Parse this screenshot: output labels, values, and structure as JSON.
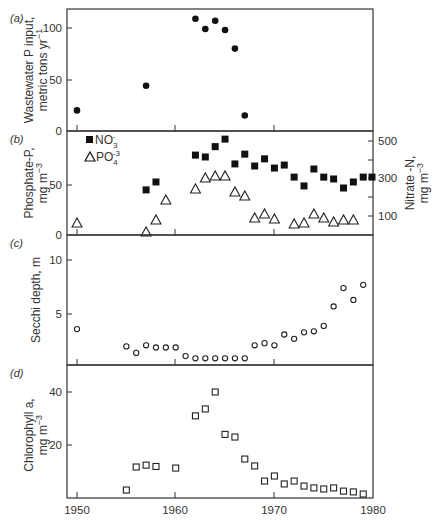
{
  "chart_data": [
    {
      "panel": "(a)",
      "type": "scatter",
      "title": "",
      "xlabel": "",
      "ylabel": "Wastewater P input, metric tons yr^-1",
      "ylabel_lines": [
        "Wastewater P input,",
        "metric tons yr",
        "−1"
      ],
      "ylim": [
        0,
        118
      ],
      "yticks": [
        0,
        50,
        100
      ],
      "xlim": [
        1949,
        1980
      ],
      "grid": false,
      "series": [
        {
          "name": "Wastewater P input",
          "marker": "filled-circle",
          "points": [
            [
              1950,
              20
            ],
            [
              1957,
              44
            ],
            [
              1962,
              109
            ],
            [
              1963,
              99
            ],
            [
              1964,
              107
            ],
            [
              1965,
              98
            ],
            [
              1966,
              80
            ],
            [
              1967,
              15
            ]
          ]
        }
      ]
    },
    {
      "panel": "(b)",
      "type": "scatter",
      "title": "",
      "xlabel": "",
      "ylabel": "Phosphate-P, mg m^-3",
      "ylabel_lines": [
        "Phosphate-P,",
        "mg m",
        "−3"
      ],
      "ylabel_right": "Nitrate-N, mg m^-3",
      "ylabel_right_lines": [
        "Nitrate -N,",
        "mg m",
        "−3"
      ],
      "ylim": [
        0,
        104
      ],
      "yticks": [
        0,
        50
      ],
      "ylim_right": [
        0,
        555
      ],
      "yticks_right": [
        100,
        300,
        500
      ],
      "yticks_right_minor": [
        200,
        400
      ],
      "xlim": [
        1949,
        1980
      ],
      "grid": false,
      "legend": {
        "position": "upper-left",
        "entries": [
          "NO3-",
          "PO4-3"
        ]
      },
      "series": [
        {
          "name": "NO3-",
          "axis": "right",
          "marker": "filled-square",
          "points": [
            [
              1957,
              240
            ],
            [
              1958,
              282
            ],
            [
              1962,
              425
            ],
            [
              1963,
              415
            ],
            [
              1964,
              470
            ],
            [
              1965,
              510
            ],
            [
              1966,
              378
            ],
            [
              1967,
              430
            ],
            [
              1968,
              367
            ],
            [
              1969,
              405
            ],
            [
              1970,
              356
            ],
            [
              1971,
              372
            ],
            [
              1972,
              308
            ],
            [
              1973,
              261
            ],
            [
              1974,
              351
            ],
            [
              1975,
              308
            ],
            [
              1976,
              298
            ],
            [
              1977,
              250
            ],
            [
              1978,
              282
            ],
            [
              1979,
              308
            ],
            [
              1980,
              308
            ]
          ]
        },
        {
          "name": "PO4-3",
          "axis": "left",
          "marker": "open-triangle",
          "points": [
            [
              1950,
              12
            ],
            [
              1957,
              3
            ],
            [
              1958,
              15
            ],
            [
              1959,
              35
            ],
            [
              1962,
              46
            ],
            [
              1963,
              57
            ],
            [
              1964,
              59
            ],
            [
              1965,
              59
            ],
            [
              1966,
              43
            ],
            [
              1967,
              39
            ],
            [
              1968,
              17
            ],
            [
              1969,
              21
            ],
            [
              1970,
              16
            ],
            [
              1972,
              11
            ],
            [
              1973,
              12
            ],
            [
              1974,
              21
            ],
            [
              1975,
              17
            ],
            [
              1976,
              13
            ],
            [
              1977,
              15
            ],
            [
              1978,
              15
            ]
          ]
        }
      ]
    },
    {
      "panel": "(c)",
      "type": "scatter",
      "title": "",
      "xlabel": "",
      "ylabel": "Secchi depth, m",
      "ylabel_lines": [
        "Secchi depth, m"
      ],
      "ylim": [
        0.3,
        10.0
      ],
      "yticks": [
        5,
        10
      ],
      "xlim": [
        1949,
        1980
      ],
      "grid": false,
      "series": [
        {
          "name": "Secchi depth",
          "marker": "open-circle",
          "points": [
            [
              1950,
              3.6
            ],
            [
              1955,
              2.0
            ],
            [
              1956,
              1.4
            ],
            [
              1957,
              2.1
            ],
            [
              1958,
              1.9
            ],
            [
              1959,
              1.9
            ],
            [
              1960,
              1.9
            ],
            [
              1961,
              1.1
            ],
            [
              1962,
              0.9
            ],
            [
              1963,
              0.9
            ],
            [
              1964,
              0.9
            ],
            [
              1965,
              0.9
            ],
            [
              1966,
              0.9
            ],
            [
              1967,
              0.9
            ],
            [
              1968,
              2.1
            ],
            [
              1969,
              2.3
            ],
            [
              1970,
              2.1
            ],
            [
              1971,
              3.1
            ],
            [
              1972,
              2.7
            ],
            [
              1973,
              3.3
            ],
            [
              1974,
              3.4
            ],
            [
              1975,
              3.9
            ],
            [
              1976,
              5.7
            ],
            [
              1977,
              7.4
            ],
            [
              1978,
              6.3
            ],
            [
              1979,
              7.7
            ]
          ]
        }
      ]
    },
    {
      "panel": "(d)",
      "type": "scatter",
      "title": "",
      "xlabel": "",
      "ylabel": "Chlorophyll a, mg m^-3",
      "ylabel_lines": [
        "Chlorophyll a,",
        "mg m",
        "−3"
      ],
      "ylim": [
        0,
        50
      ],
      "yticks": [
        20,
        40
      ],
      "xlim": [
        1949,
        1980
      ],
      "xticks": [
        1950,
        1960,
        1970,
        1980
      ],
      "grid": false,
      "series": [
        {
          "name": "Chlorophyll a",
          "marker": "open-square",
          "points": [
            [
              1955,
              3
            ],
            [
              1956,
              11.7
            ],
            [
              1957,
              12.4
            ],
            [
              1958,
              11.9
            ],
            [
              1960,
              11.3
            ],
            [
              1962,
              31
            ],
            [
              1963,
              33.6
            ],
            [
              1964,
              40
            ],
            [
              1965,
              24
            ],
            [
              1966,
              23
            ],
            [
              1967,
              14.7
            ],
            [
              1968,
              12.1
            ],
            [
              1969,
              6.4
            ],
            [
              1970,
              8.3
            ],
            [
              1971,
              5.3
            ],
            [
              1972,
              6.4
            ],
            [
              1973,
              4.5
            ],
            [
              1974,
              3.8
            ],
            [
              1975,
              3.4
            ],
            [
              1976,
              3.8
            ],
            [
              1977,
              2.6
            ],
            [
              1978,
              2.3
            ],
            [
              1979,
              1.5
            ]
          ]
        }
      ]
    }
  ],
  "labels": {
    "panel_a": "(a)",
    "panel_b": "(b)",
    "panel_c": "(c)",
    "panel_d": "(d)",
    "a_ylabel_1": "Wastewater P input,",
    "a_ylabel_2": "metric tons yr",
    "a_ylabel_sup": "−1",
    "b_ylabel_1": "Phosphate-P,",
    "b_ylabel_2": "mg m",
    "b_ylabel_sup": "−3",
    "b_ylabel_r1": "Nitrate -N,",
    "b_ylabel_r2": "mg m",
    "b_ylabel_rsup": "−3",
    "c_ylabel": "Secchi depth, m",
    "d_ylabel_1": "Chlorophyll a,",
    "d_ylabel_2": "mg m",
    "d_ylabel_sup": "−3",
    "legend_no3": "NO",
    "legend_no3_sub": "3",
    "legend_no3_sup": "-",
    "legend_po4": "PO",
    "legend_po4_sub": "4",
    "legend_po4_sup": "-3"
  },
  "ticks": {
    "a": [
      "0",
      "50",
      "100"
    ],
    "b_left": [
      "0",
      "50"
    ],
    "b_right": [
      "100",
      "300",
      "500"
    ],
    "c": [
      "5",
      "10"
    ],
    "d": [
      "20",
      "40"
    ],
    "x": [
      "1950",
      "1960",
      "1970",
      "1980"
    ]
  }
}
